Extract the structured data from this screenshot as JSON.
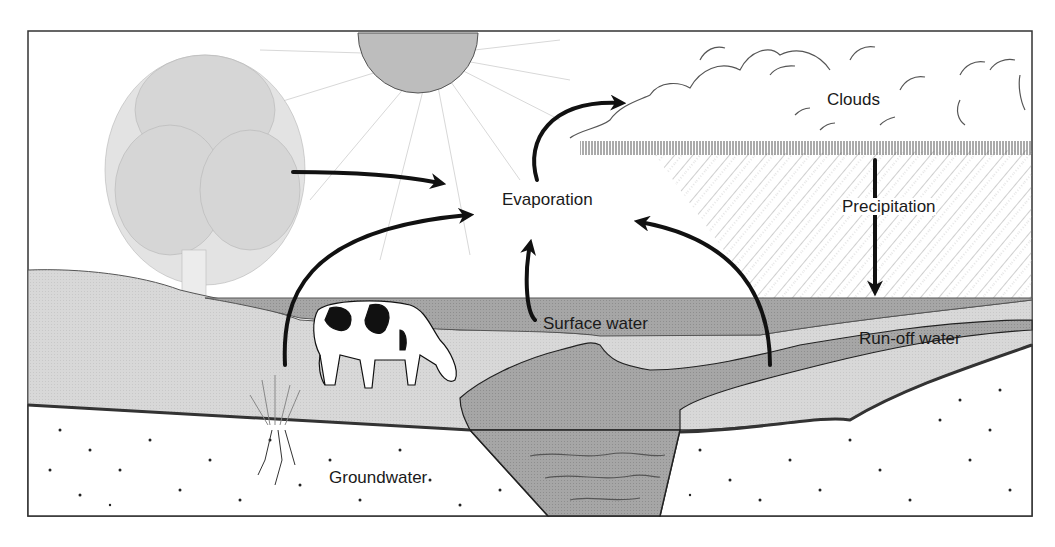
{
  "diagram": {
    "type": "water-cycle",
    "labels": {
      "clouds": "Clouds",
      "evaporation": "Evaporation",
      "precipitation": "Precipitation",
      "surface_water": "Surface water",
      "runoff_water": "Run-off water",
      "groundwater": "Groundwater"
    },
    "elements": [
      "sun",
      "tree",
      "clouds",
      "rain",
      "cow",
      "grass-with-roots",
      "river",
      "lake",
      "soil",
      "groundwater"
    ],
    "arrows": [
      {
        "from": "tree",
        "to": "evaporation",
        "meaning": "transpiration"
      },
      {
        "from": "grass",
        "to": "evaporation"
      },
      {
        "from": "surface_water",
        "to": "evaporation"
      },
      {
        "from": "runoff_land",
        "to": "evaporation"
      },
      {
        "from": "evaporation",
        "to": "clouds"
      },
      {
        "from": "clouds",
        "to": "ground",
        "meaning": "precipitation"
      }
    ],
    "colors": {
      "sun": "#bdbdbd",
      "land": "#d6d6d6",
      "water": "#a9a9a9",
      "soil": "#ffffff",
      "ink": "#111111",
      "tree": "#c4c4c4"
    }
  }
}
